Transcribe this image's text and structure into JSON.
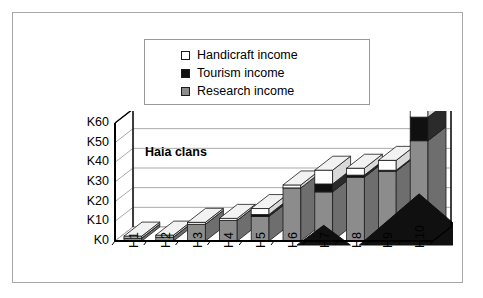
{
  "chart_data": {
    "type": "bar",
    "subtype": "stacked-3d-column",
    "title": "Haia clans",
    "xlabel": "",
    "ylabel": "",
    "categories": [
      "H1",
      "H2",
      "H3",
      "H4",
      "H5",
      "H6",
      "H7",
      "H8",
      "H9",
      "H10"
    ],
    "series": [
      {
        "name": "Research income",
        "color": "#8c8c8c",
        "values": [
          1.5,
          2,
          8.5,
          10.5,
          12.5,
          27,
          25,
          32.5,
          35.5,
          51
        ]
      },
      {
        "name": "Tourism income",
        "color": "#101010",
        "values": [
          0,
          0,
          0,
          0,
          1,
          0,
          4,
          1,
          0.5,
          12
        ]
      },
      {
        "name": "Handicraft income",
        "color": "#ffffff",
        "values": [
          1,
          1,
          1,
          1,
          3,
          1.5,
          7,
          3.5,
          5,
          3.5
        ]
      }
    ],
    "totals": [
      2.5,
      3,
      9.5,
      11.5,
      16.5,
      28.5,
      32,
      36,
      40.5,
      54.5
    ],
    "ytick_labels": [
      "K0",
      "K10",
      "K20",
      "K30",
      "K40",
      "K50",
      "K60"
    ],
    "ytick_values": [
      0,
      10,
      20,
      30,
      40,
      50,
      60
    ],
    "ylim": [
      0,
      60
    ],
    "grid": true,
    "legend_position": "top"
  },
  "legend": {
    "items": [
      {
        "label": "Handicraft income",
        "swatch": "white-square-icon"
      },
      {
        "label": "Tourism income",
        "swatch": "black-square-icon"
      },
      {
        "label": "Research income",
        "swatch": "gray-square-icon"
      }
    ]
  },
  "colors": {
    "research": "#8c8c8c",
    "tourism": "#101010",
    "handicraft": "#ffffff",
    "axis": "#000000",
    "grid": "#a9a9a9",
    "frame": "#a8a8a8"
  }
}
